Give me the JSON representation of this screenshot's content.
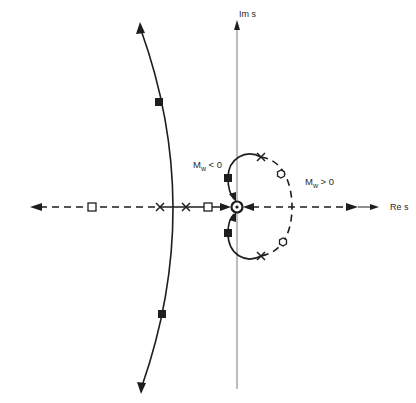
{
  "diagram": {
    "type": "root-locus",
    "axes": {
      "imag_label": "Im s",
      "real_label": "Re s"
    },
    "annotations": {
      "mw_negative": {
        "base": "M",
        "sub": "w",
        "rel": " < 0"
      },
      "mw_positive": {
        "base": "M",
        "sub": "w",
        "rel": " > 0"
      }
    },
    "markers": {
      "poles_x": [
        [
          160,
          207
        ],
        [
          186,
          207
        ],
        [
          261,
          157
        ],
        [
          261,
          256
        ]
      ],
      "zeros_open_square": [
        [
          92,
          207
        ],
        [
          208,
          207
        ]
      ],
      "zeros_open_hex": [
        [
          281,
          174
        ],
        [
          283,
          242
        ]
      ],
      "gain_filled_square": [
        [
          159,
          102
        ],
        [
          162,
          314
        ],
        [
          228,
          178
        ],
        [
          228,
          233
        ]
      ],
      "origin_double_circle": [
        237,
        207
      ]
    },
    "legend_hint": {
      "solid": "M_w < 0 branch",
      "dashed": "M_w > 0 branch"
    }
  }
}
